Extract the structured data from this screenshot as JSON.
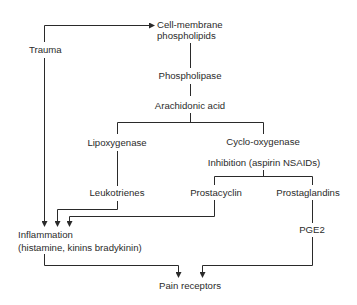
{
  "diagram": {
    "type": "flowchart",
    "nodes": {
      "trauma": "Trauma",
      "cell_membrane_line1": "Cell-membrane",
      "cell_membrane_line2": "phospholipids",
      "phospholipase": "Phospholipase",
      "arachidonic_acid": "Arachidonic acid",
      "lipoxygenase": "Lipoxygenase",
      "cyclooxygenase_line1": "Cyclo-oxygenase",
      "cyclooxygenase_line2": "Inhibition (aspirin NSAIDs)",
      "leukotrienes": "Leukotrienes",
      "prostacyclin": "Prostacyclin",
      "prostaglandins": "Prostaglandins",
      "inflammation_line1": "Inflammation",
      "inflammation_line2": "(histamine, kinins bradykinin)",
      "pge2": "PGE2",
      "pain_receptors": "Pain receptors"
    },
    "edges": [
      {
        "from": "Trauma",
        "to": "Cell-membrane phospholipids",
        "arrow": true
      },
      {
        "from": "Cell-membrane phospholipids",
        "to": "Phospholipase",
        "arrow": false
      },
      {
        "from": "Phospholipase",
        "to": "Arachidonic acid",
        "arrow": false
      },
      {
        "from": "Arachidonic acid",
        "to": "Lipoxygenase",
        "arrow": false
      },
      {
        "from": "Arachidonic acid",
        "to": "Cyclo-oxygenase",
        "arrow": false
      },
      {
        "from": "Lipoxygenase",
        "to": "Leukotrienes",
        "arrow": false
      },
      {
        "from": "Cyclo-oxygenase",
        "to": "Prostacyclin",
        "arrow": false
      },
      {
        "from": "Cyclo-oxygenase",
        "to": "Prostaglandins",
        "arrow": false
      },
      {
        "from": "Trauma",
        "to": "Inflammation",
        "arrow": true
      },
      {
        "from": "Leukotrienes",
        "to": "Inflammation",
        "arrow": true
      },
      {
        "from": "Prostacyclin",
        "to": "Inflammation",
        "arrow": true
      },
      {
        "from": "Prostaglandins",
        "to": "PGE2",
        "arrow": false
      },
      {
        "from": "Inflammation",
        "to": "Pain receptors",
        "arrow": true
      },
      {
        "from": "PGE2",
        "to": "Pain receptors",
        "arrow": true
      }
    ],
    "line_color": "#2a2a2a"
  }
}
